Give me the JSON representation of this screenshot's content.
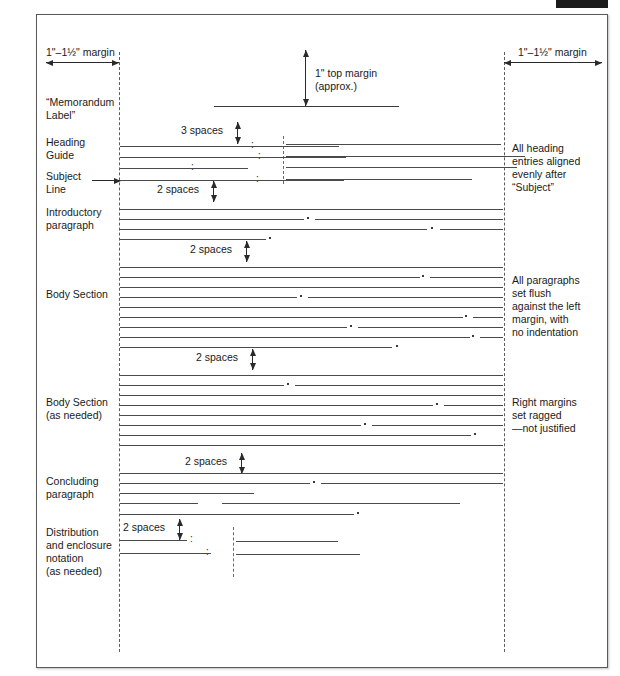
{
  "figure": {
    "margins": {
      "left_label": "1\"–1½\" margin",
      "right_label": "1\"–1½\" margin",
      "top_label": "1\" top margin\n(approx.)"
    },
    "left_labels": [
      {
        "id": "memorandum-label",
        "text": "“Memorandum\nLabel”"
      },
      {
        "id": "heading-guide",
        "text": "Heading\nGuide"
      },
      {
        "id": "subject-line",
        "text": "Subject\nLine"
      },
      {
        "id": "introductory-paragraph",
        "text": "Introductory\nparagraph"
      },
      {
        "id": "body-section",
        "text": "Body Section"
      },
      {
        "id": "body-section-as-needed",
        "text": "Body Section\n(as needed)"
      },
      {
        "id": "concluding-paragraph",
        "text": "Concluding\nparagraph"
      },
      {
        "id": "distribution-notation",
        "text": "Distribution\nand enclosure\nnotation\n(as needed)"
      }
    ],
    "right_notes": [
      {
        "id": "heading-alignment-note",
        "text": "All heading\nentries aligned\nevenly after\n“Subject”"
      },
      {
        "id": "paragraph-flush-note",
        "text": "All paragraphs\nset flush\nagainst the left\nmargin, with\nno indentation"
      },
      {
        "id": "ragged-right-note",
        "text": "Right margins\nset ragged\n—not justified"
      }
    ],
    "spacing_callouts": [
      {
        "id": "spacing-heading",
        "text": "3 spaces"
      },
      {
        "id": "spacing-subject",
        "text": "2 spaces"
      },
      {
        "id": "spacing-intro",
        "text": "2 spaces"
      },
      {
        "id": "spacing-body",
        "text": "2 spaces"
      },
      {
        "id": "spacing-body2",
        "text": "2 spaces"
      },
      {
        "id": "spacing-concluding",
        "text": "2 spaces"
      },
      {
        "id": "spacing-distribution",
        "text": "2 spaces"
      }
    ],
    "colors": {
      "frame": "#5a5a5a",
      "guide": "#5d5d5d",
      "rule": "#4a4a4a",
      "arrow": "#2a2a2a",
      "registration_bar": "#1b1b1b",
      "background": "#ffffff"
    }
  }
}
